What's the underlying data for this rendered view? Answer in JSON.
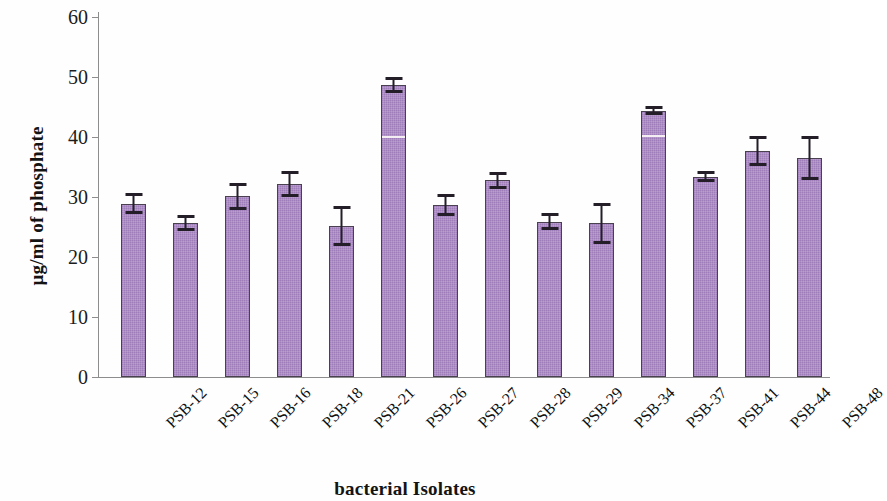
{
  "chart_data": {
    "type": "bar",
    "title": "",
    "xlabel": "bacterial Isolates",
    "ylabel": "µg/ml of phosphate",
    "ylim": [
      0,
      60
    ],
    "yticks": [
      0,
      10,
      20,
      30,
      40,
      50,
      60
    ],
    "grid": false,
    "legend": null,
    "bar_color": "#a884c4",
    "bar_edge_color": "#4a4150",
    "error_bar_color": "#241e28",
    "categories": [
      "PSB-12",
      "PSB-15",
      "PSB-16",
      "PSB-18",
      "PSB-21",
      "PSB-26",
      "PSB-27",
      "PSB-28",
      "PSB-29",
      "PSB-34",
      "PSB-37",
      "PSB-41",
      "PSB-44",
      "PSB-48"
    ],
    "values": [
      28.9,
      25.7,
      30.1,
      32.2,
      25.2,
      48.7,
      28.7,
      32.8,
      25.9,
      25.6,
      44.4,
      33.4,
      37.7,
      36.5
    ],
    "errors": [
      1.7,
      1.3,
      2.3,
      2.2,
      3.3,
      1.3,
      1.8,
      1.4,
      1.4,
      3.4,
      0.8,
      0.9,
      2.5,
      3.6
    ]
  },
  "yaxis": {
    "ticks": [
      "0",
      "10",
      "20",
      "30",
      "40",
      "50",
      "60"
    ]
  },
  "axis_titles": {
    "y": "µg/ml of phosphate",
    "x": "bacterial Isolates"
  }
}
